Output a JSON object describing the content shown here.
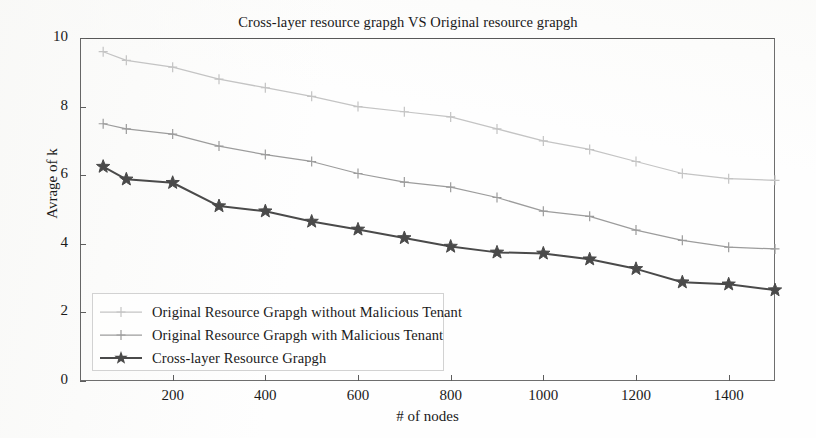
{
  "chart_data": {
    "type": "line",
    "title": "Cross-layer resource grapgh VS Original resource grapgh",
    "xlabel": "# of nodes",
    "ylabel": "Avrage of k",
    "xlim": [
      0,
      1500
    ],
    "ylim": [
      0,
      10
    ],
    "xticks": [
      200,
      400,
      600,
      800,
      1000,
      1200,
      1400
    ],
    "yticks": [
      0,
      2,
      4,
      6,
      8,
      10
    ],
    "grid": false,
    "legend_position": "lower-left",
    "x": [
      50,
      100,
      200,
      300,
      400,
      500,
      600,
      700,
      800,
      900,
      1000,
      1100,
      1200,
      1300,
      1400,
      1500
    ],
    "series": [
      {
        "name": "Original Resource Grapgh without Malicious Tenant",
        "color": "#c4c4c4",
        "marker": "plus",
        "values": [
          9.6,
          9.35,
          9.15,
          8.8,
          8.55,
          8.3,
          8.0,
          7.85,
          7.7,
          7.35,
          7.0,
          6.75,
          6.4,
          6.05,
          5.9,
          5.85
        ]
      },
      {
        "name": "Original Resource Grapgh with Malicious Tenant",
        "color": "#9c9c9c",
        "marker": "plus",
        "values": [
          7.5,
          7.35,
          7.2,
          6.85,
          6.6,
          6.4,
          6.05,
          5.8,
          5.65,
          5.35,
          4.95,
          4.8,
          4.4,
          4.1,
          3.9,
          3.85
        ]
      },
      {
        "name": "Cross-layer Resource Grapgh",
        "color": "#4a4a4a",
        "marker": "star",
        "values": [
          6.25,
          5.88,
          5.78,
          5.1,
          4.95,
          4.65,
          4.42,
          4.17,
          3.92,
          3.75,
          3.72,
          3.55,
          3.27,
          2.88,
          2.82,
          2.65
        ]
      }
    ]
  },
  "axis": {
    "ytick_labels": [
      "10",
      "8",
      "6",
      "4",
      "2",
      "0"
    ],
    "xtick_labels": [
      "200",
      "400",
      "600",
      "800",
      "1000",
      "1200",
      "1400"
    ]
  },
  "legend": {
    "entries": [
      "Original Resource Grapgh without Malicious Tenant",
      "Original Resource Grapgh with Malicious Tenant",
      "Cross-layer Resource Grapgh"
    ]
  }
}
